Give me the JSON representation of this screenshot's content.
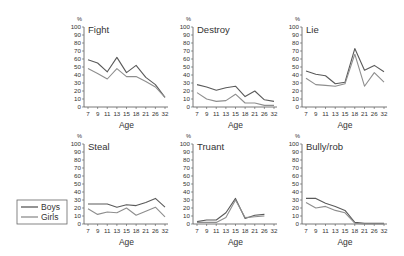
{
  "figure": {
    "boys_color": "#5a5a5a",
    "girls_color": "#8e8e8e",
    "axis_color": "#555555"
  },
  "legend": {
    "entries": [
      {
        "label": "Boys",
        "color": "#5a5a5a"
      },
      {
        "label": "Girls",
        "color": "#8e8e8e"
      }
    ]
  },
  "chart_data": [
    {
      "type": "line",
      "title": "Fight",
      "xlabel": "Age",
      "ylabel": "%",
      "categories": [
        "7",
        "9",
        "11",
        "13",
        "15",
        "18",
        "21",
        "26",
        "32"
      ],
      "yticks": [
        0,
        10,
        20,
        30,
        40,
        50,
        60,
        70,
        80,
        90,
        100
      ],
      "ylim": [
        0,
        100
      ],
      "grid": false,
      "series": [
        {
          "name": "Boys",
          "values": [
            59,
            55,
            44,
            62,
            43,
            52,
            37,
            28,
            12
          ]
        },
        {
          "name": "Girls",
          "values": [
            48,
            42,
            35,
            48,
            38,
            38,
            32,
            25,
            12
          ]
        }
      ]
    },
    {
      "type": "line",
      "title": "Destroy",
      "xlabel": "Age",
      "ylabel": "%",
      "categories": [
        "7",
        "9",
        "11",
        "13",
        "15",
        "18",
        "21",
        "26",
        "32"
      ],
      "yticks": [
        0,
        10,
        20,
        30,
        40,
        50,
        60,
        70,
        80,
        90,
        100
      ],
      "ylim": [
        0,
        100
      ],
      "grid": false,
      "series": [
        {
          "name": "Boys",
          "values": [
            28,
            25,
            21,
            24,
            26,
            13,
            20,
            9,
            7
          ]
        },
        {
          "name": "Girls",
          "values": [
            18,
            10,
            7,
            8,
            16,
            5,
            5,
            2,
            2
          ]
        }
      ]
    },
    {
      "type": "line",
      "title": "Lie",
      "xlabel": "Age",
      "ylabel": "%",
      "categories": [
        "7",
        "9",
        "11",
        "13",
        "15",
        "18",
        "21",
        "26",
        "32"
      ],
      "yticks": [
        0,
        10,
        20,
        30,
        40,
        50,
        60,
        70,
        80,
        90,
        100
      ],
      "ylim": [
        0,
        100
      ],
      "grid": false,
      "series": [
        {
          "name": "Boys",
          "values": [
            45,
            41,
            39,
            29,
            31,
            73,
            46,
            52,
            44
          ]
        },
        {
          "name": "Girls",
          "values": [
            36,
            28,
            27,
            26,
            29,
            66,
            26,
            43,
            31
          ]
        }
      ]
    },
    {
      "type": "line",
      "title": "Steal",
      "xlabel": "Age",
      "ylabel": "%",
      "categories": [
        "7",
        "9",
        "11",
        "13",
        "15",
        "18",
        "21",
        "26",
        "32"
      ],
      "yticks": [
        0,
        10,
        20,
        30,
        40,
        50,
        60,
        70,
        80,
        90,
        100
      ],
      "ylim": [
        0,
        100
      ],
      "grid": false,
      "series": [
        {
          "name": "Boys",
          "values": [
            25,
            25,
            25,
            21,
            24,
            23,
            27,
            32,
            21
          ]
        },
        {
          "name": "Girls",
          "values": [
            19,
            12,
            15,
            14,
            20,
            11,
            16,
            21,
            9
          ]
        }
      ]
    },
    {
      "type": "line",
      "title": "Truant",
      "xlabel": "Age",
      "ylabel": "%",
      "categories": [
        "7",
        "9",
        "11",
        "13",
        "15",
        "18",
        "21",
        "26",
        "32"
      ],
      "yticks": [
        0,
        10,
        20,
        30,
        40,
        50,
        60,
        70,
        80,
        90,
        100
      ],
      "ylim": [
        0,
        100
      ],
      "grid": false,
      "series": [
        {
          "name": "Boys",
          "values": [
            3,
            5,
            5,
            14,
            32,
            7,
            11,
            12,
            null
          ]
        },
        {
          "name": "Girls",
          "values": [
            2,
            2,
            2,
            8,
            30,
            8,
            9,
            10,
            null
          ]
        }
      ]
    },
    {
      "type": "line",
      "title": "Bully/rob",
      "xlabel": "Age",
      "ylabel": "%",
      "categories": [
        "7",
        "9",
        "11",
        "13",
        "15",
        "18",
        "21",
        "26",
        "32"
      ],
      "yticks": [
        0,
        10,
        20,
        30,
        40,
        50,
        60,
        70,
        80,
        90,
        100
      ],
      "ylim": [
        0,
        100
      ],
      "grid": false,
      "series": [
        {
          "name": "Boys",
          "values": [
            32,
            32,
            26,
            22,
            17,
            2,
            1,
            1,
            1
          ]
        },
        {
          "name": "Girls",
          "values": [
            27,
            20,
            22,
            17,
            14,
            1,
            0,
            0,
            0
          ]
        }
      ]
    }
  ],
  "layout": {
    "panels": [
      {
        "axis_x": 84,
        "y_zero": 107,
        "y_hundred": 27,
        "x_first": 88,
        "x_last": 165
      },
      {
        "axis_x": 193,
        "y_zero": 107,
        "y_hundred": 27,
        "x_first": 197,
        "x_last": 274
      },
      {
        "axis_x": 302,
        "y_zero": 107,
        "y_hundred": 27,
        "x_first": 306,
        "x_last": 384
      },
      {
        "axis_x": 84,
        "y_zero": 224,
        "y_hundred": 144,
        "x_first": 88,
        "x_last": 165
      },
      {
        "axis_x": 193,
        "y_zero": 224,
        "y_hundred": 144,
        "x_first": 197,
        "x_last": 274
      },
      {
        "axis_x": 302,
        "y_zero": 224,
        "y_hundred": 144,
        "x_first": 306,
        "x_last": 384
      }
    ]
  }
}
